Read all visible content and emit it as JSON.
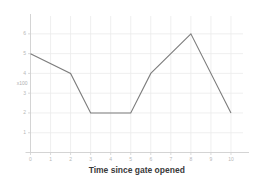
{
  "chart_data": {
    "type": "line",
    "title": "",
    "xlabel": "Time since gate opened",
    "ylabel": "x100",
    "x": [
      0,
      2,
      3,
      5,
      6,
      8,
      10
    ],
    "values": [
      5,
      4,
      2,
      2,
      4,
      6,
      2
    ],
    "series": [
      {
        "name": "flow",
        "x": [
          0,
          2,
          3,
          5,
          6,
          8,
          10
        ],
        "values": [
          5,
          4,
          2,
          2,
          4,
          6,
          2
        ]
      }
    ],
    "xlim": [
      0,
      10.6
    ],
    "ylim": [
      0,
      6.6
    ],
    "xticks": [
      0,
      1,
      2,
      3,
      4,
      5,
      6,
      7,
      8,
      9,
      10
    ],
    "xtick_labels": [
      "0",
      "1",
      "2",
      "3",
      "4",
      "5",
      "6",
      "7",
      "8",
      "9",
      "10"
    ],
    "yticks": [
      1,
      2,
      3,
      4,
      5,
      6
    ],
    "ytick_labels": [
      "1",
      "2",
      "3",
      "4",
      "5",
      "6"
    ],
    "grid": true,
    "legend": false,
    "line_color": "#7d7d7d",
    "grid_color": "#ebebeb",
    "axis_color": "#d0d0d0",
    "tick_label_color": "#b8b8b8",
    "title_color": "#3a3a3a",
    "background_color": "#ffffff"
  },
  "axis": {
    "x_title": "Time since gate opened",
    "y_unit": "x100"
  }
}
